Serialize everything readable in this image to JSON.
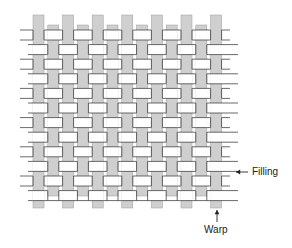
{
  "diagram": {
    "type": "plain-weave",
    "labels": {
      "filling": "Filling",
      "warp": "Warp"
    },
    "colors": {
      "warp_fill": "#cfcfcf",
      "filling_fill": "#ffffff",
      "outline": "#444444",
      "text": "#222222"
    },
    "grid": {
      "warp_count": 13,
      "filling_count": 12,
      "warp_x0": 33,
      "warp_pitch": 14.8,
      "warp_width": 11,
      "filling_y0": 30,
      "filling_pitch": 14.6,
      "filling_height": 10,
      "warp_top_even": 15,
      "warp_top_odd": 25,
      "warp_bottom_even": 208,
      "warp_bottom_odd": 196,
      "filling_left_long": 20,
      "filling_left_short": 28,
      "filling_right_long": 238,
      "filling_right_short": 230
    },
    "arrows": {
      "filling": {
        "x1": 248,
        "y1": 172,
        "x2": 236,
        "y2": 172
      },
      "warp": {
        "x1": 217,
        "y1": 222,
        "x2": 217,
        "y2": 210
      }
    }
  }
}
